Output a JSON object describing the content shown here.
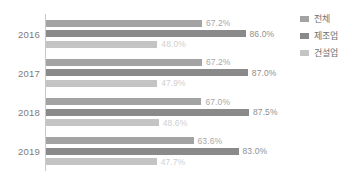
{
  "chart_data": {
    "type": "bar",
    "orientation": "horizontal",
    "title": "",
    "xlabel": "",
    "ylabel": "",
    "xlim": [
      0,
      100
    ],
    "grid": false,
    "legend_position": "right",
    "categories": [
      "2016",
      "2017",
      "2018",
      "2019"
    ],
    "series": [
      {
        "name": "전체",
        "color": "#a3a3a3",
        "values": [
          67.2,
          67.2,
          67.0,
          63.6
        ],
        "labels": [
          "67.2%",
          "67.2%",
          "67.0%",
          "63.6%"
        ]
      },
      {
        "name": "제조업",
        "color": "#8a8a8a",
        "values": [
          86.0,
          87.0,
          87.5,
          83.0
        ],
        "labels": [
          "86.0%",
          "87.0%",
          "87.5%",
          "83.0%"
        ]
      },
      {
        "name": "건설업",
        "color": "#c4c4c4",
        "values": [
          48.0,
          47.9,
          48.6,
          47.7
        ],
        "labels": [
          "48.0%",
          "47.9%",
          "48.6%",
          "47.7%"
        ]
      }
    ]
  },
  "legend": {
    "items": [
      {
        "label": "전체"
      },
      {
        "label": "제조업"
      },
      {
        "label": "건설업"
      }
    ]
  }
}
